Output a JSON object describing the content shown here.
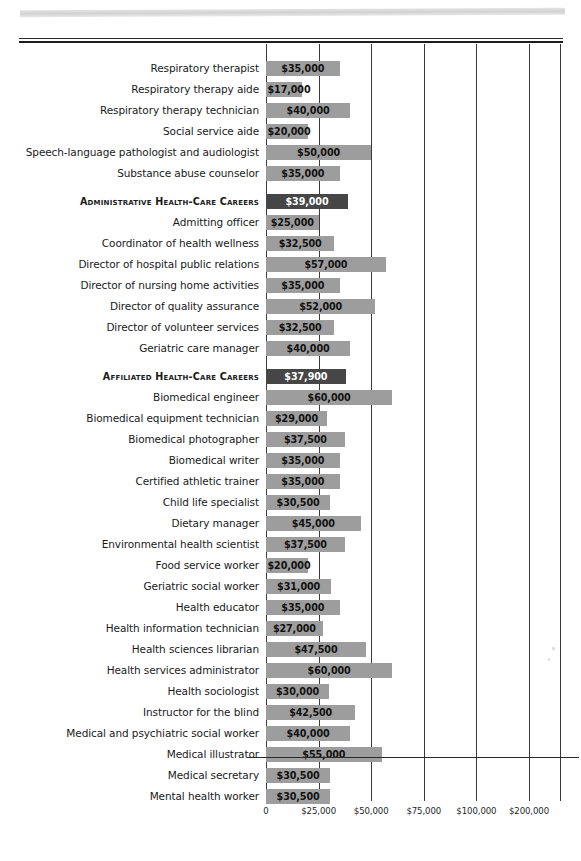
{
  "chart_data": {
    "type": "bar",
    "orientation": "horizontal",
    "title": "",
    "xlabel": "",
    "ylabel": "",
    "grid": true,
    "legend": null,
    "axis_ticks": [
      {
        "label": "0",
        "value": 0
      },
      {
        "label": "$25,000",
        "value": 25000
      },
      {
        "label": "$50,000",
        "value": 50000
      },
      {
        "label": "$75,000",
        "value": 75000
      },
      {
        "label": "$100,000",
        "value": 100000
      },
      {
        "label": "$200,000",
        "value": 200000
      }
    ],
    "axis_note": "broken / non-linear axis: equal spacing between 25k increments then 100k to 200k",
    "categories": [
      "Respiratory therapist",
      "Respiratory therapy aide",
      "Respiratory therapy technician",
      "Social service aide",
      "Speech-language pathologist and audiologist",
      "Substance abuse counselor",
      "Administrative Health-Care Careers",
      "Admitting officer",
      "Coordinator of health wellness",
      "Director of hospital public relations",
      "Director of nursing home activities",
      "Director of quality assurance",
      "Director of volunteer services",
      "Geriatric care manager",
      "Affiliated Health-Care Careers",
      "Biomedical engineer",
      "Biomedical equipment technician",
      "Biomedical photographer",
      "Biomedical writer",
      "Certified athletic trainer",
      "Child life specialist",
      "Dietary manager",
      "Environmental health scientist",
      "Food service worker",
      "Geriatric social worker",
      "Health educator",
      "Health information technician",
      "Health sciences librarian",
      "Health services administrator",
      "Health sociologist",
      "Instructor for the blind",
      "Medical and psychiatric social worker",
      "Medical illustrator",
      "Medical secretary",
      "Mental health worker"
    ],
    "values": [
      35000,
      17000,
      40000,
      20000,
      50000,
      35000,
      39000,
      25000,
      32500,
      57000,
      35000,
      52000,
      32500,
      40000,
      37900,
      60000,
      29000,
      37500,
      35000,
      35000,
      30500,
      45000,
      37500,
      20000,
      31000,
      35000,
      27000,
      47500,
      60000,
      30000,
      42500,
      40000,
      55000,
      30500,
      30500
    ],
    "value_labels": [
      "$35,000",
      "$17,000",
      "$40,000",
      "$20,000",
      "$50,000",
      "$35,000",
      "$39,000",
      "$25,000",
      "$32,500",
      "$57,000",
      "$35,000",
      "$52,000",
      "$32,500",
      "$40,000",
      "$37,900",
      "$60,000",
      "$29,000",
      "$37,500",
      "$35,000",
      "$35,000",
      "$30,500",
      "$45,000",
      "$37,500",
      "$20,000",
      "$31,000",
      "$35,000",
      "$27,000",
      "$47,500",
      "$60,000",
      "$30,000",
      "$42,500",
      "$40,000",
      "$55,000",
      "$30,500",
      "$30,500"
    ],
    "section_indices": [
      6,
      14
    ],
    "gap_before_indices": [
      6,
      14
    ],
    "colors": {
      "bar": "#9d9d9d",
      "section_bar": "#464646",
      "axis": "#3a3a3a",
      "text": "#1a1a1a",
      "section_text": "#ffffff"
    }
  }
}
